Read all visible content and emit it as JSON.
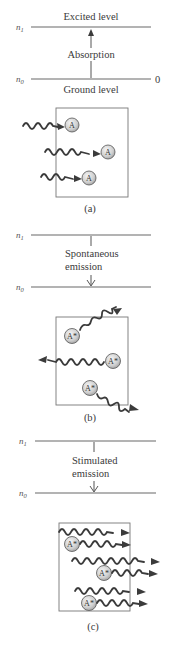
{
  "panels": [
    {
      "id": "a",
      "caption": "(a)",
      "upper_level_label": "n",
      "upper_level_sub": "1",
      "lower_level_label": "n",
      "lower_level_sub": "0",
      "upper_level_name": "Excited level",
      "lower_level_name": "Ground level",
      "zero_label": "0",
      "process_label_line1": "Absorption",
      "process_label_line2": "",
      "transition_direction": "up",
      "atom_label": "A",
      "atom_count": 3
    },
    {
      "id": "b",
      "caption": "(b)",
      "upper_level_label": "n",
      "upper_level_sub": "1",
      "lower_level_label": "n",
      "lower_level_sub": "0",
      "process_label_line1": "Spontaneous",
      "process_label_line2": "emission",
      "transition_direction": "down",
      "atom_label": "A*",
      "atom_count": 3
    },
    {
      "id": "c",
      "caption": "(c)",
      "upper_level_label": "n",
      "upper_level_sub": "1",
      "lower_level_label": "n",
      "lower_level_sub": "0",
      "process_label_line1": "Stimulated",
      "process_label_line2": "emission",
      "transition_direction": "down",
      "atom_label": "A*",
      "atom_count": 3
    }
  ]
}
